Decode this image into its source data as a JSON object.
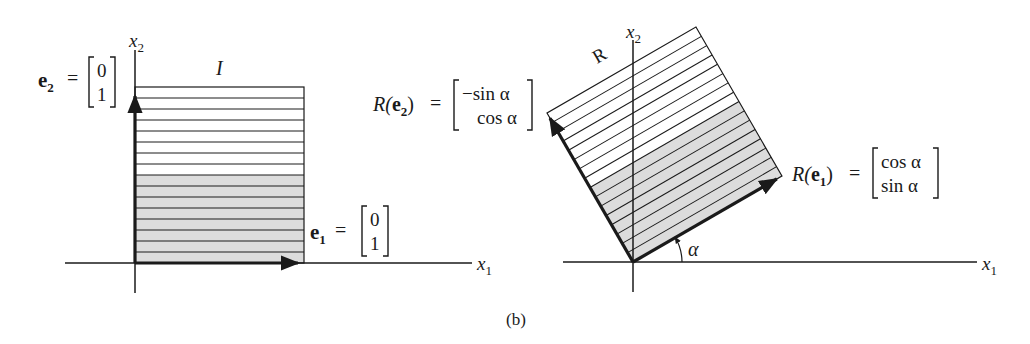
{
  "figure": {
    "caption": "(b)",
    "colors": {
      "ink": "#1a1a1a",
      "shade": "#dcdcdc",
      "background": "#ffffff"
    }
  },
  "left_panel": {
    "x_axis_label": "x",
    "x_axis_sub": "1",
    "y_axis_label": "x",
    "y_axis_sub": "2",
    "region_label": "I",
    "e2": {
      "name": "e",
      "sub": "2",
      "eq": "=",
      "vector": [
        "0",
        "1"
      ]
    },
    "e1": {
      "name": "e",
      "sub": "1",
      "eq": "=",
      "vector": [
        "0",
        "1"
      ]
    },
    "stripes": 16,
    "shaded_stripes": 8
  },
  "right_panel": {
    "x_axis_label": "x",
    "x_axis_sub": "1",
    "y_axis_label": "x",
    "y_axis_sub": "2",
    "region_label": "R",
    "angle_label": "α",
    "angle_degrees": 30,
    "Re2": {
      "prefix": "R(",
      "name": "e",
      "sub": "2",
      "suffix": ")",
      "eq": "=",
      "vector": [
        "−sin α",
        "cos α"
      ]
    },
    "Re1": {
      "prefix": "R(",
      "name": "e",
      "sub": "1",
      "suffix": ")",
      "eq": "=",
      "vector": [
        "cos α",
        "sin α"
      ]
    }
  }
}
